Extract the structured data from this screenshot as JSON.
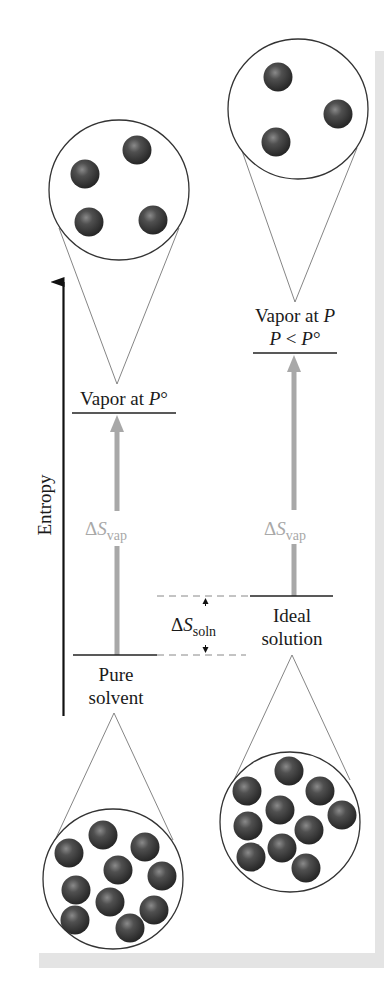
{
  "diagram": {
    "axis": {
      "label": "Entropy"
    },
    "levels": {
      "vapor_pure": {
        "label_prefix": "Vapor at ",
        "label_var": "P",
        "label_suffix": "°"
      },
      "vapor_solution": {
        "line1_prefix": "Vapor at ",
        "line1_var": "P",
        "line2_var1": "P",
        "line2_op": " < ",
        "line2_var2": "P",
        "line2_suffix": "°"
      },
      "pure_solvent": {
        "line1": "Pure",
        "line2": "solvent"
      },
      "ideal_solution": {
        "line1": "Ideal",
        "line2": "solution"
      }
    },
    "arrows": {
      "left_vap": {
        "delta": "Δ",
        "symbol": "S",
        "subscript": "vap"
      },
      "right_vap": {
        "delta": "Δ",
        "symbol": "S",
        "subscript": "vap"
      },
      "soln": {
        "delta": "Δ",
        "symbol": "S",
        "subscript": "soln"
      }
    },
    "circles": [
      {
        "name": "pure-vapor-molecules",
        "molecule_count": 4
      },
      {
        "name": "solution-vapor-molecules",
        "molecule_count": 3
      },
      {
        "name": "pure-solvent-molecules",
        "molecule_count": 10
      },
      {
        "name": "ideal-solution-molecules",
        "molecule_count": 10
      }
    ],
    "colors": {
      "line": "#1a1a1a",
      "gray_arrow": "#a8a8a8",
      "frame": "#e2e2e2",
      "molecule": "#3c3c3c"
    }
  }
}
